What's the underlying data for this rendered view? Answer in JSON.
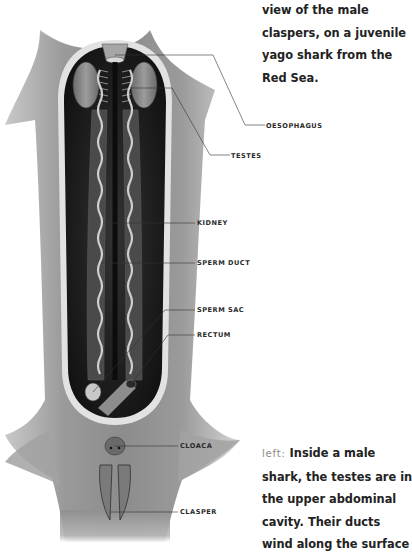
{
  "figure": {
    "labels": [
      {
        "id": "oesophagus",
        "text": "OESOPHAGUS"
      },
      {
        "id": "testes",
        "text": "TESTES"
      },
      {
        "id": "kidney",
        "text": "KIDNEY"
      },
      {
        "id": "sperm_duct",
        "text": "SPERM DUCT"
      },
      {
        "id": "sperm_sac",
        "text": "SPERM SAC"
      },
      {
        "id": "rectum",
        "text": "RECTUM"
      },
      {
        "id": "cloaca",
        "text": "CLOACA"
      },
      {
        "id": "clasper",
        "text": "CLASPER"
      }
    ]
  },
  "caption_top": {
    "lines": [
      "view of the male",
      "claspers, on a juvenile",
      "yago shark from the",
      "Red Sea."
    ]
  },
  "caption_bottom": {
    "lead": "left:",
    "first_line_rest": " Inside a male",
    "lines": [
      "shark, the testes are in",
      "the upper abdominal",
      "cavity. Their ducts",
      "wind along the surface"
    ]
  }
}
